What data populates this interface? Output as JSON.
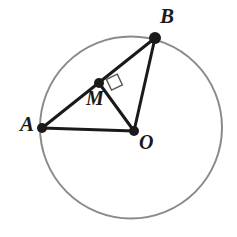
{
  "figure": {
    "kind": "circle-geometry-diagram",
    "background_color": "#ffffff",
    "width": 237,
    "height": 237
  },
  "circle": {
    "name": "circumscribed-circle",
    "center_x": 131,
    "center_y": 127.5,
    "radius": 91,
    "stroke_color": "#8a8a8a",
    "stroke_width": 2,
    "fill": "none"
  },
  "points": [
    {
      "id": "A",
      "label": "A",
      "x": 42,
      "y": 128,
      "dot_radius": 5,
      "on_circle": true,
      "label_x": 20,
      "label_y": 114
    },
    {
      "id": "B",
      "label": "B",
      "x": 155,
      "y": 38,
      "dot_radius": 6,
      "on_circle": true,
      "label_x": 160,
      "label_y": 6
    },
    {
      "id": "M",
      "label": "M",
      "x": 99,
      "y": 83,
      "dot_radius": 5,
      "on_circle": false,
      "label_x": 86,
      "label_y": 88
    },
    {
      "id": "O",
      "label": "O",
      "x": 134,
      "y": 131,
      "dot_radius": 5,
      "on_circle": false,
      "label_x": 139,
      "label_y": 132
    }
  ],
  "segments": [
    {
      "id": "AB",
      "from": "A",
      "to": "B",
      "x1": 42,
      "y1": 128,
      "x2": 155,
      "y2": 38,
      "stroke_color": "#1a1a1a",
      "stroke_width": 3
    },
    {
      "id": "AO",
      "from": "A",
      "to": "O",
      "x1": 42,
      "y1": 128,
      "x2": 134,
      "y2": 131,
      "stroke_color": "#1a1a1a",
      "stroke_width": 3
    },
    {
      "id": "MO",
      "from": "M",
      "to": "O",
      "x1": 99,
      "y1": 83,
      "x2": 134,
      "y2": 131,
      "stroke_color": "#1a1a1a",
      "stroke_width": 3
    },
    {
      "id": "BO",
      "from": "B",
      "to": "O",
      "x1": 155,
      "y1": 38,
      "x2": 134,
      "y2": 131,
      "stroke_color": "#1a1a1a",
      "stroke_width": 3
    }
  ],
  "right_angle_marker": {
    "id": "right-angle-at-M",
    "at_point": "M",
    "between": [
      "MB",
      "MO"
    ],
    "points": "106.4,79.3 117.3,74.1 122.4,84.9 111.5,90.1",
    "stroke_color": "#555555",
    "stroke_width": 1.4,
    "fill": "none"
  },
  "colors": {
    "stroke_dark": "#1a1a1a",
    "stroke_circle": "#8a8a8a",
    "marker_gray": "#555555",
    "background": "#ffffff"
  }
}
